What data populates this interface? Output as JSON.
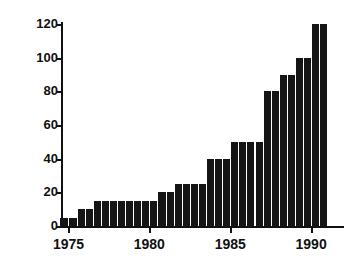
{
  "chart_data": {
    "type": "bar",
    "title": "",
    "subtitle": "",
    "xlabel": "",
    "ylabel": "",
    "xlim": [
      1974.6,
      1991.6
    ],
    "ylim": [
      0,
      120
    ],
    "grid": false,
    "legend": null,
    "bar_color": "#151515",
    "axis_color": "#111111",
    "background_color": "#ffffff",
    "ytick_values": [
      0,
      20,
      40,
      60,
      80,
      100,
      120
    ],
    "ytick_labels": [
      "0",
      "20",
      "40",
      "60",
      "80",
      "100",
      "120"
    ],
    "xtick_values": [
      1975,
      1980,
      1985,
      1990
    ],
    "xtick_labels": [
      "1975",
      "1980",
      "1985",
      "1990"
    ],
    "bar_width_years": 0.5,
    "x": [
      1974.75,
      1975.25,
      1975.75,
      1976.25,
      1976.75,
      1977.25,
      1977.75,
      1978.25,
      1978.75,
      1979.25,
      1979.75,
      1980.25,
      1980.75,
      1981.25,
      1981.75,
      1982.25,
      1982.75,
      1983.25,
      1983.75,
      1984.25,
      1984.75,
      1985.25,
      1985.75,
      1986.25,
      1986.75,
      1987.25,
      1987.75,
      1988.25,
      1988.75,
      1989.25,
      1989.75,
      1990.25,
      1990.75
    ],
    "categories": [
      "1974.75",
      "1975.25",
      "1975.75",
      "1976.25",
      "1976.75",
      "1977.25",
      "1977.75",
      "1978.25",
      "1978.75",
      "1979.25",
      "1979.75",
      "1980.25",
      "1980.75",
      "1981.25",
      "1981.75",
      "1982.25",
      "1982.75",
      "1983.25",
      "1983.75",
      "1984.25",
      "1984.75",
      "1985.25",
      "1985.75",
      "1986.25",
      "1986.75",
      "1987.25",
      "1987.75",
      "1988.25",
      "1988.75",
      "1989.25",
      "1989.75",
      "1990.25",
      "1990.75"
    ],
    "values": [
      5,
      5,
      10,
      10,
      15,
      15,
      15,
      15,
      15,
      15,
      15,
      15,
      20,
      20,
      25,
      25,
      25,
      25,
      40,
      40,
      40,
      50,
      50,
      50,
      50,
      80,
      80,
      90,
      90,
      100,
      100,
      120,
      120
    ]
  }
}
